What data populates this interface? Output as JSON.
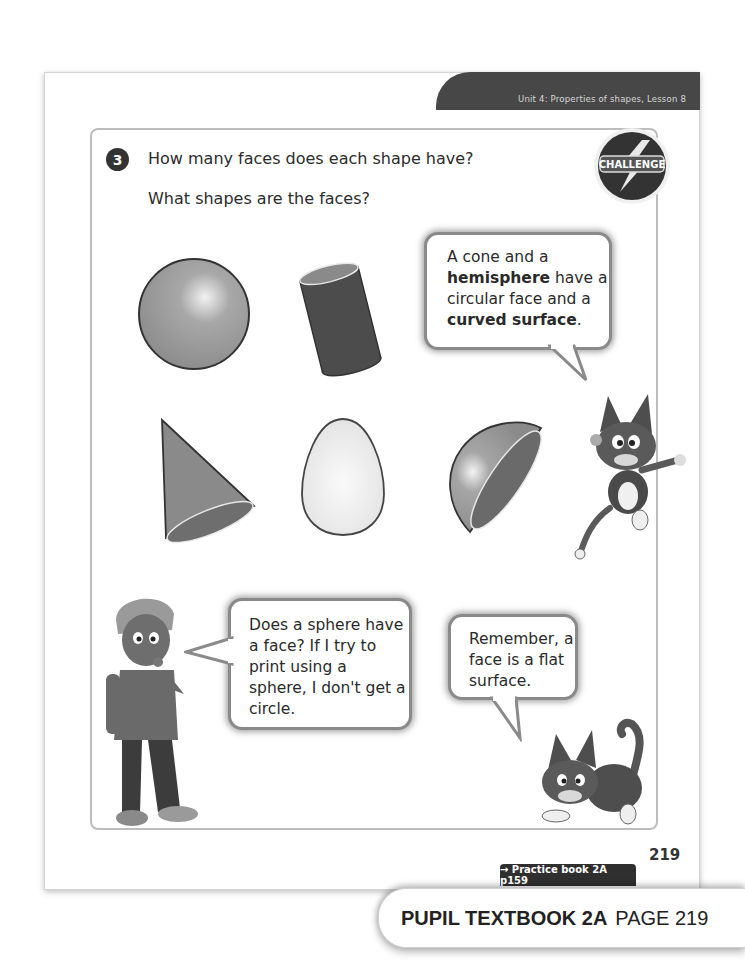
{
  "header": {
    "unit_label": "Unit 4: Properties of shapes, Lesson 8"
  },
  "question": {
    "number": "3",
    "line1": "How many faces does each shape have?",
    "line2": "What shapes are the faces?",
    "badge_label": "CHALLENGE"
  },
  "shapes": [
    {
      "name": "sphere"
    },
    {
      "name": "cylinder"
    },
    {
      "name": "cone"
    },
    {
      "name": "egg"
    },
    {
      "name": "hemisphere"
    }
  ],
  "bubbles": {
    "cone_hemisphere": {
      "parts": [
        "A cone and a ",
        "hemisphere",
        " have a circular face and a ",
        "curved surface",
        "."
      ]
    },
    "sphere_question": {
      "text": "Does a sphere have a face? If I try to print using a sphere, I don't get a circle."
    },
    "face_reminder": {
      "text": "Remember, a face is a flat surface."
    }
  },
  "footer": {
    "page_number": "219",
    "practice_link": "→ Practice book 2A p159",
    "book_label": "PUPIL TEXTBOOK 2A",
    "page_label": "PAGE 219"
  },
  "colors": {
    "header_tab": "#474747",
    "frame_border": "#bdbdbd",
    "bubble_border": "#8a8a8a",
    "shape_dark": "#4a4a4a",
    "shape_mid": "#8e8e8e",
    "shape_light": "#ececec"
  }
}
